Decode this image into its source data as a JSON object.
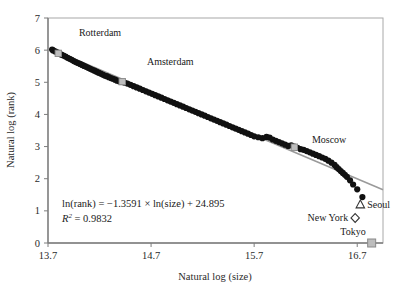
{
  "chart_data": {
    "type": "scatter",
    "title": "",
    "xlabel": "Natural log (size)",
    "ylabel": "Natural log (rank)",
    "xlim": [
      13.7,
      16.95
    ],
    "ylim": [
      0,
      7
    ],
    "xticks": [
      "13.7",
      "14.7",
      "15.7",
      "16.7"
    ],
    "xtick_values": [
      13.7,
      14.7,
      15.7,
      16.7
    ],
    "yticks": [
      "0",
      "1",
      "2",
      "3",
      "4",
      "5",
      "6",
      "7"
    ],
    "ytick_values": [
      0,
      1,
      2,
      3,
      4,
      5,
      6,
      7
    ],
    "grid": false,
    "legend": "none",
    "series": [
      {
        "name": "cities",
        "marker": "filled-circle",
        "color": "#111111",
        "points": [
          [
            13.74,
            6.02
          ],
          [
            13.75,
            5.99
          ],
          [
            13.77,
            5.96
          ],
          [
            13.79,
            5.93
          ],
          [
            13.81,
            5.9
          ],
          [
            13.83,
            5.86
          ],
          [
            13.85,
            5.83
          ],
          [
            13.87,
            5.8
          ],
          [
            13.89,
            5.76
          ],
          [
            13.91,
            5.73
          ],
          [
            13.93,
            5.7
          ],
          [
            13.95,
            5.66
          ],
          [
            13.97,
            5.63
          ],
          [
            13.99,
            5.6
          ],
          [
            14.01,
            5.57
          ],
          [
            14.03,
            5.54
          ],
          [
            14.05,
            5.51
          ],
          [
            14.07,
            5.48
          ],
          [
            14.09,
            5.45
          ],
          [
            14.11,
            5.42
          ],
          [
            14.13,
            5.39
          ],
          [
            14.15,
            5.36
          ],
          [
            14.17,
            5.33
          ],
          [
            14.19,
            5.3
          ],
          [
            14.21,
            5.27
          ],
          [
            14.23,
            5.24
          ],
          [
            14.25,
            5.21
          ],
          [
            14.27,
            5.19
          ],
          [
            14.29,
            5.16
          ],
          [
            14.31,
            5.13
          ],
          [
            14.33,
            5.11
          ],
          [
            14.35,
            5.08
          ],
          [
            14.37,
            5.05
          ],
          [
            14.39,
            5.03
          ],
          [
            14.41,
            5.01
          ],
          [
            14.44,
            4.99
          ],
          [
            14.47,
            4.96
          ],
          [
            14.5,
            4.92
          ],
          [
            14.53,
            4.88
          ],
          [
            14.56,
            4.84
          ],
          [
            14.59,
            4.8
          ],
          [
            14.62,
            4.76
          ],
          [
            14.65,
            4.72
          ],
          [
            14.68,
            4.68
          ],
          [
            14.71,
            4.64
          ],
          [
            14.74,
            4.6
          ],
          [
            14.77,
            4.56
          ],
          [
            14.8,
            4.52
          ],
          [
            14.83,
            4.48
          ],
          [
            14.86,
            4.44
          ],
          [
            14.89,
            4.4
          ],
          [
            14.92,
            4.36
          ],
          [
            14.95,
            4.32
          ],
          [
            14.98,
            4.28
          ],
          [
            15.01,
            4.24
          ],
          [
            15.04,
            4.2
          ],
          [
            15.07,
            4.16
          ],
          [
            15.1,
            4.12
          ],
          [
            15.13,
            4.08
          ],
          [
            15.16,
            4.04
          ],
          [
            15.19,
            4.0
          ],
          [
            15.22,
            3.96
          ],
          [
            15.25,
            3.92
          ],
          [
            15.28,
            3.88
          ],
          [
            15.31,
            3.84
          ],
          [
            15.34,
            3.8
          ],
          [
            15.37,
            3.76
          ],
          [
            15.4,
            3.72
          ],
          [
            15.43,
            3.68
          ],
          [
            15.46,
            3.64
          ],
          [
            15.49,
            3.6
          ],
          [
            15.52,
            3.56
          ],
          [
            15.55,
            3.52
          ],
          [
            15.58,
            3.48
          ],
          [
            15.61,
            3.44
          ],
          [
            15.64,
            3.4
          ],
          [
            15.67,
            3.36
          ],
          [
            15.7,
            3.32
          ],
          [
            15.74,
            3.29
          ],
          [
            15.78,
            3.26
          ],
          [
            15.82,
            3.3
          ],
          [
            15.85,
            3.28
          ],
          [
            15.88,
            3.22
          ],
          [
            15.91,
            3.18
          ],
          [
            15.94,
            3.14
          ],
          [
            15.97,
            3.1
          ],
          [
            16.0,
            3.06
          ],
          [
            16.03,
            3.02
          ],
          [
            16.06,
            3.04
          ],
          [
            16.09,
            3.0
          ],
          [
            16.12,
            2.96
          ],
          [
            16.15,
            2.92
          ],
          [
            16.18,
            2.9
          ],
          [
            16.21,
            2.86
          ],
          [
            16.24,
            2.82
          ],
          [
            16.27,
            2.78
          ],
          [
            16.3,
            2.74
          ],
          [
            16.33,
            2.7
          ],
          [
            16.36,
            2.66
          ],
          [
            16.39,
            2.62
          ],
          [
            16.42,
            2.56
          ],
          [
            16.45,
            2.5
          ],
          [
            16.48,
            2.43
          ],
          [
            16.5,
            2.36
          ],
          [
            16.52,
            2.3
          ],
          [
            16.54,
            2.24
          ],
          [
            16.56,
            2.18
          ],
          [
            16.58,
            2.12
          ],
          [
            16.6,
            2.06
          ],
          [
            16.63,
            1.95
          ],
          [
            16.66,
            1.82
          ],
          [
            16.7,
            1.67
          ],
          [
            16.75,
            1.43
          ]
        ]
      }
    ],
    "highlighted_cities": [
      {
        "name": "Rotterdam",
        "x": 13.8,
        "y": 5.9,
        "marker": "gray-square",
        "label_x": 14.0,
        "label_y": 6.45
      },
      {
        "name": "Amsterdam",
        "x": 14.42,
        "y": 5.02,
        "marker": "gray-square",
        "label_x": 14.66,
        "label_y": 5.55
      },
      {
        "name": "Moscow",
        "x": 16.09,
        "y": 2.98,
        "marker": "gray-square",
        "label_x": 16.26,
        "label_y": 3.12
      }
    ],
    "special_markers": [
      {
        "name": "Seoul",
        "x": 16.73,
        "y": 1.2,
        "marker": "open-triangle",
        "label_side": "right"
      },
      {
        "name": "New York",
        "x": 16.68,
        "y": 0.78,
        "marker": "open-diamond",
        "label_side": "left"
      },
      {
        "name": "Tokyo",
        "x": 16.84,
        "y": 0.0,
        "marker": "gray-square",
        "label_side": "above"
      }
    ],
    "trendline": {
      "name": "regression-line",
      "color": "#9a9a9a",
      "equation_text": "ln(rank) = −1.3591 × ln(size) + 24.895",
      "slope": -1.3591,
      "intercept": 24.895,
      "r_squared_label": "R",
      "r_squared_sup": "2",
      "r_squared_text": " = 0.9832",
      "r_squared_value": 0.9832,
      "x_start": 13.74,
      "y_start": 6.02,
      "x_end": 16.95,
      "y_end": 1.66
    }
  },
  "figure": {
    "axis_color": "#8c8c8c",
    "point_color": "#111111",
    "trend_color": "#9a9a9a",
    "marker_fill": "#bdbdbd",
    "background": "#ffffff"
  }
}
